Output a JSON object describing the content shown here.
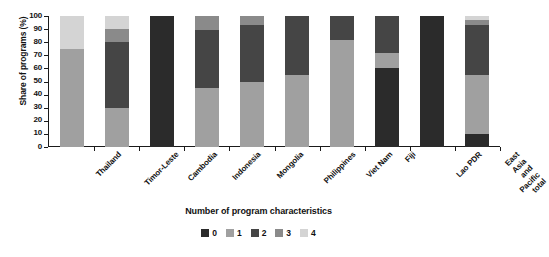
{
  "chart_data": {
    "type": "bar",
    "subtype": "stacked-bar-100",
    "title": "",
    "xlabel": "Number of program characteristics",
    "ylabel": "Share of programs (%)",
    "ylim": [
      0,
      100
    ],
    "yticks": [
      0,
      10,
      20,
      30,
      40,
      50,
      60,
      70,
      80,
      90,
      100
    ],
    "grid": false,
    "legend_position": "bottom",
    "categories": [
      "Thailand",
      "Timor-Leste",
      "Cambodia",
      "Indonesia",
      "Mongolia",
      "Philippines",
      "Viet Nam",
      "Fiji",
      "Lao PDR",
      "East Asia and\nPacific total"
    ],
    "series": [
      {
        "name": "0",
        "color": "#2b2b2b",
        "values": [
          0,
          0,
          100,
          0,
          0,
          0,
          0,
          60,
          100,
          10
        ]
      },
      {
        "name": "1",
        "color": "#a0a0a0",
        "values": [
          75,
          30,
          0,
          45,
          50,
          55,
          82,
          12,
          0,
          45
        ]
      },
      {
        "name": "2",
        "color": "#454545",
        "values": [
          0,
          50,
          0,
          44,
          43,
          45,
          18,
          28,
          0,
          38
        ]
      },
      {
        "name": "3",
        "color": "#8a8a8a",
        "values": [
          0,
          10,
          0,
          11,
          7,
          0,
          0,
          0,
          0,
          4
        ]
      },
      {
        "name": "4",
        "color": "#d4d4d4",
        "values": [
          25,
          10,
          0,
          0,
          0,
          0,
          0,
          0,
          0,
          3
        ]
      }
    ],
    "legend_entries": [
      {
        "label": "0",
        "color": "#2b2b2b"
      },
      {
        "label": "1",
        "color": "#a0a0a0"
      },
      {
        "label": "2",
        "color": "#454545"
      },
      {
        "label": "3",
        "color": "#8a8a8a"
      },
      {
        "label": "4",
        "color": "#d4d4d4"
      }
    ]
  }
}
